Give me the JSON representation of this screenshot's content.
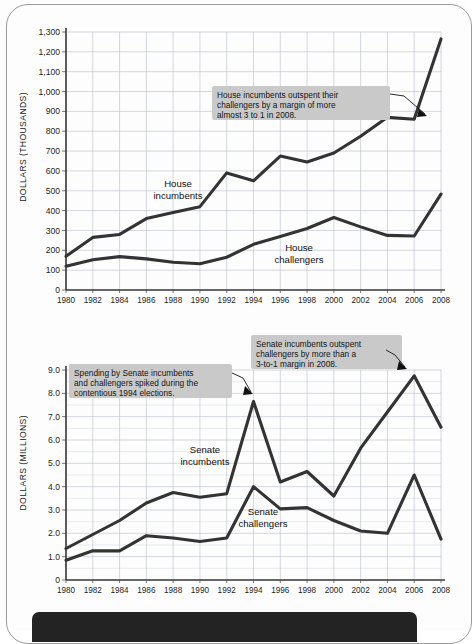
{
  "figure": {
    "background_color": "#fdfdfd",
    "line_color": "#333333",
    "callout_bg": "#c9c9c9",
    "grid_color": "#b9bec9"
  },
  "charts": [
    {
      "id": "house",
      "ylabel": "DOLLARS (THOUSANDS)",
      "yticks": [
        "0",
        "100",
        "200",
        "300",
        "400",
        "500",
        "600",
        "700",
        "800",
        "900",
        "1,000",
        "1,100",
        "1,200",
        "1,300"
      ],
      "xticks": [
        "1980",
        "1982",
        "1984",
        "1986",
        "1988",
        "1990",
        "1992",
        "1994",
        "1996",
        "1998",
        "2000",
        "2002",
        "2004",
        "2006",
        "2008"
      ],
      "series_labels": [
        {
          "name": "house-incumbents-label",
          "text_line1": "House",
          "text_line2": "incumbents"
        },
        {
          "name": "house-challengers-label",
          "text_line1": "House",
          "text_line2": "challengers"
        }
      ],
      "callout": {
        "line1": "House incumbents outspent their",
        "line2": "challengers by a margin of more",
        "line3": "almost 3 to 1 in 2008."
      }
    },
    {
      "id": "senate",
      "ylabel": "DOLLARS (MILLIONS)",
      "yticks": [
        "0",
        "1.0",
        "2.0",
        "3.0",
        "4.0",
        "5.0",
        "6.0",
        "7.0",
        "8.0",
        "9.0"
      ],
      "xticks": [
        "1980",
        "1982",
        "1984",
        "1986",
        "1988",
        "1990",
        "1992",
        "1994",
        "1996",
        "1998",
        "2000",
        "2002",
        "2004",
        "2006",
        "2008"
      ],
      "series_labels": [
        {
          "name": "senate-incumbents-label",
          "text_line1": "Senate",
          "text_line2": "incumbents"
        },
        {
          "name": "senate-challengers-label",
          "text_line1": "Senate",
          "text_line2": "challengers"
        }
      ],
      "callout_left": {
        "line1": "Spending by Senate incumbents",
        "line2": "and challengers spiked during the",
        "line3": "contentious 1994 elections."
      },
      "callout_right": {
        "line1": "Senate incumbents outspent",
        "line2": "challengers by more than a",
        "line3": "3-to-1 margin in 2008."
      }
    }
  ],
  "chart_data": [
    {
      "type": "line",
      "title": "",
      "xlabel": "",
      "ylabel": "DOLLARS (THOUSANDS)",
      "categories": [
        1980,
        1982,
        1984,
        1986,
        1988,
        1990,
        1992,
        1994,
        1996,
        1998,
        2000,
        2002,
        2004,
        2006,
        2008
      ],
      "xlim": [
        1980,
        2008
      ],
      "ylim": [
        0,
        1300
      ],
      "ytick_step": 100,
      "grid": true,
      "legend": "inline-labels",
      "series": [
        {
          "name": "House incumbents",
          "values": [
            170,
            265,
            280,
            360,
            390,
            420,
            590,
            550,
            675,
            645,
            690,
            775,
            870,
            860,
            1265
          ]
        },
        {
          "name": "House challengers",
          "values": [
            120,
            152,
            168,
            157,
            140,
            132,
            165,
            230,
            270,
            310,
            365,
            318,
            275,
            272,
            483
          ]
        }
      ],
      "annotations": [
        {
          "text": "House incumbents outspent their challengers by a margin of more almost 3 to 1 in 2008.",
          "points_to": {
            "x": 2006,
            "y": 860
          }
        }
      ]
    },
    {
      "type": "line",
      "title": "",
      "xlabel": "",
      "ylabel": "DOLLARS (MILLIONS)",
      "categories": [
        1980,
        1982,
        1984,
        1986,
        1988,
        1990,
        1992,
        1994,
        1996,
        1998,
        2000,
        2002,
        2004,
        2006,
        2008
      ],
      "xlim": [
        1980,
        2008
      ],
      "ylim": [
        0,
        9.0
      ],
      "ytick_step": 1.0,
      "minor_ytick_step": 0.5,
      "grid": true,
      "legend": "inline-labels",
      "series": [
        {
          "name": "Senate incumbents",
          "values": [
            1.35,
            1.95,
            2.55,
            3.3,
            3.75,
            3.55,
            3.7,
            7.65,
            4.2,
            4.65,
            3.6,
            5.65,
            7.2,
            8.75,
            6.55
          ]
        },
        {
          "name": "Senate challengers",
          "values": [
            0.85,
            1.25,
            1.25,
            1.9,
            1.8,
            1.65,
            1.8,
            4.0,
            3.05,
            3.1,
            2.55,
            2.1,
            2.0,
            4.5,
            1.75
          ]
        }
      ],
      "annotations": [
        {
          "text": "Spending by Senate incumbents and challengers spiked during the contentious 1994 elections.",
          "points_to": {
            "x": 1994,
            "y": 7.65
          }
        },
        {
          "text": "Senate incumbents outspent challengers by more than a 3-to-1 margin in 2008.",
          "points_to": {
            "x": 2006,
            "y": 8.75
          }
        }
      ]
    }
  ]
}
